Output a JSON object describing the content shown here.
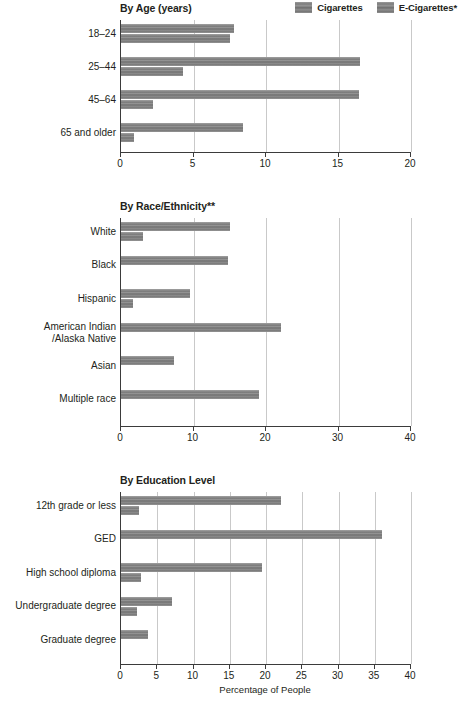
{
  "legend": {
    "items": [
      {
        "label": "Cigarettes",
        "color": "#7f7f7f",
        "key": "cigarettes"
      },
      {
        "label": "E-Cigarettes*",
        "color": "#7f7f7f",
        "key": "ecigarettes"
      }
    ]
  },
  "axis_title": "Percentage of People",
  "chart_data": [
    {
      "type": "bar",
      "orientation": "horizontal",
      "title": "By Age (years)",
      "categories": [
        "18–24",
        "25–44",
        "45–64",
        "65 and older"
      ],
      "series": [
        {
          "name": "Cigarettes",
          "values": [
            7.8,
            16.5,
            16.4,
            8.4
          ]
        },
        {
          "name": "E-Cigarettes*",
          "values": [
            7.5,
            4.3,
            2.2,
            0.9
          ]
        }
      ],
      "xlabel": "",
      "ylabel": "",
      "xlim": [
        0,
        20
      ],
      "xticks": [
        0,
        5,
        10,
        15,
        20
      ],
      "grid": true,
      "legend_position": "top-right"
    },
    {
      "type": "bar",
      "orientation": "horizontal",
      "title": "By Race/Ethnicity**",
      "categories": [
        "White",
        "Black",
        "Hispanic",
        "American Indian\n/Alaska Native",
        "Asian",
        "Multiple race"
      ],
      "series": [
        {
          "name": "Cigarettes",
          "values": [
            15.1,
            14.7,
            9.5,
            22.1,
            7.3,
            19.1
          ]
        },
        {
          "name": "E-Cigarettes*",
          "values": [
            3.0,
            0,
            1.7,
            0,
            0,
            0
          ]
        }
      ],
      "xlabel": "",
      "ylabel": "",
      "xlim": [
        0,
        40
      ],
      "xticks": [
        0,
        10,
        20,
        30,
        40
      ],
      "grid": true,
      "legend_position": "none"
    },
    {
      "type": "bar",
      "orientation": "horizontal",
      "title": "By Education Level",
      "categories": [
        "12th grade or less",
        "GED",
        "High school diploma",
        "Undergraduate degree",
        "Graduate degree"
      ],
      "series": [
        {
          "name": "Cigarettes",
          "values": [
            22.0,
            36.0,
            19.5,
            7.0,
            3.7
          ]
        },
        {
          "name": "E-Cigarettes*",
          "values": [
            2.5,
            0,
            2.7,
            2.2,
            0
          ]
        }
      ],
      "xlabel": "Percentage of People",
      "ylabel": "",
      "xlim": [
        0,
        40
      ],
      "xticks": [
        0,
        5,
        10,
        15,
        20,
        25,
        30,
        35,
        40
      ],
      "grid": true,
      "legend_position": "none"
    }
  ]
}
